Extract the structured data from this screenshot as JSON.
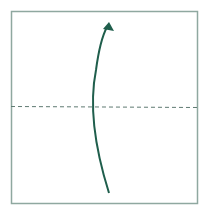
{
  "diagram": {
    "type": "origami-fold-instruction",
    "colors": {
      "paper_border": "#8fa8a0",
      "fold_line": "#5f7a72",
      "arrow": "#1f5e4c",
      "background": "#ffffff"
    },
    "paper": {
      "x": 11,
      "y": 11,
      "width": 186,
      "height": 192
    },
    "fold_line": {
      "style": "dashed",
      "y": 106,
      "x1": 11,
      "x2": 197,
      "label": "valley-fold"
    },
    "arrow": {
      "from": [
        109,
        193
      ],
      "to": [
        109,
        22
      ],
      "curve_control_x": 85,
      "direction": "up"
    }
  }
}
